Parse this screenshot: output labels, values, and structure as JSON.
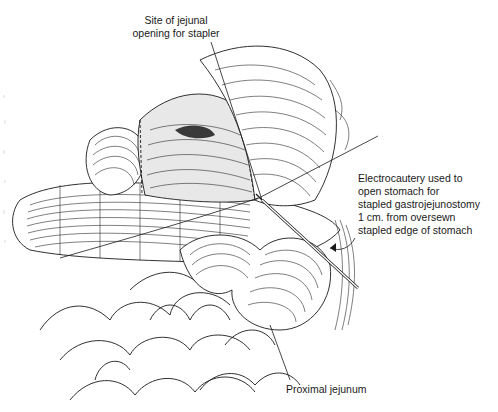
{
  "figure": {
    "background_color": "#ffffff",
    "ink_color": "#1a1a1a"
  },
  "labels": {
    "site_of_jejunal_opening": {
      "lines": [
        "Site of jejunal",
        "opening for stapler"
      ]
    },
    "electrocautery": {
      "lines": [
        "Electrocautery used to",
        "open stomach for",
        "stapled gastrojejunostomy",
        "1 cm. from oversewn",
        "stapled edge of stomach"
      ]
    },
    "proximal_jejunum": {
      "lines": [
        "Proximal jejunum"
      ]
    }
  }
}
